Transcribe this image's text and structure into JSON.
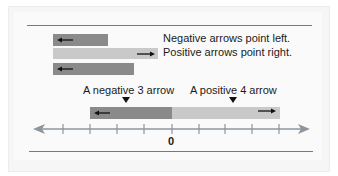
{
  "legend": {
    "negative_text": "Negative arrows point left.",
    "positive_text": "Positive arrows point right."
  },
  "labels": {
    "negative_example": "A negative 3 arrow",
    "positive_example": "A positive 4 arrow",
    "zero": "0"
  },
  "number_line": {
    "ticks": [
      -4,
      -3,
      -2,
      -1,
      0,
      1,
      2,
      3,
      4
    ],
    "negative_arrow_length": -3,
    "positive_arrow_length": 4
  },
  "colors": {
    "negative_bar": "#8a8a8a",
    "positive_bar": "#c9c9c9",
    "line": "#6d7b8a",
    "axis": "#8d969e"
  }
}
